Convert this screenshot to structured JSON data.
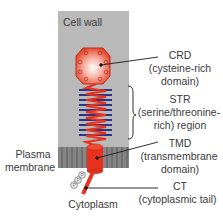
{
  "figure": {
    "regions": {
      "cell_wall": "Cell wall",
      "plasma_membrane_line1": "Plasma",
      "plasma_membrane_line2": "membrane",
      "cytoplasm": "Cytoplasm"
    },
    "labels": {
      "crd": {
        "abbr": "CRD",
        "line1": "(cysteine-rich",
        "line2": "domain)"
      },
      "str": {
        "abbr": "STR",
        "line1": "(serine/threonine-",
        "line2": "rich) region"
      },
      "tmd": {
        "abbr": "TMD",
        "line1": "(transmembrane",
        "line2": "domain)"
      },
      "ct": {
        "abbr": "CT",
        "line1": "(cytoplasmic tail)"
      }
    },
    "phospho_marks": [
      "P",
      "P",
      "P"
    ],
    "colors": {
      "cell_wall": "#b9b9b9",
      "membrane": "#7d7d7d",
      "protein_red": "#e8321e",
      "stripes_blue": "#2a3585",
      "leader_line": "#1a1a1a"
    }
  }
}
